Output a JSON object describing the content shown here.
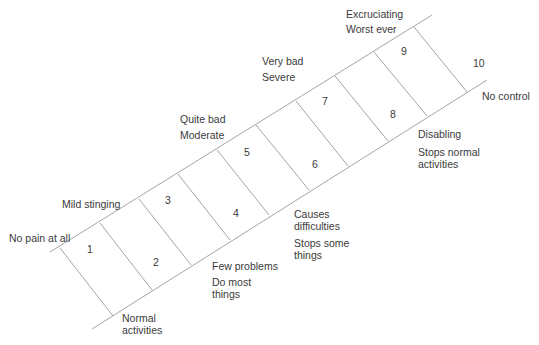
{
  "diagram": {
    "type": "pain-scale-ladder",
    "steps": [
      {
        "value": "1",
        "label": ""
      },
      {
        "value": "2",
        "label": ""
      },
      {
        "value": "3",
        "label": ""
      },
      {
        "value": "4",
        "label": ""
      },
      {
        "value": "5",
        "label": ""
      },
      {
        "value": "6",
        "label": ""
      },
      {
        "value": "7",
        "label": ""
      },
      {
        "value": "8",
        "label": ""
      },
      {
        "value": "9",
        "label": ""
      },
      {
        "value": "10",
        "label": ""
      }
    ],
    "upper_labels": {
      "no_pain": "No pain at all",
      "mild": "Mild stinging",
      "quite_bad": "Quite bad",
      "moderate": "Moderate",
      "very_bad": "Very bad",
      "severe": "Severe",
      "excruciating": "Excruciating",
      "worst_ever": "Worst ever"
    },
    "lower_labels": {
      "normal_1": "Normal",
      "normal_2": "activities",
      "few_problems": "Few problems",
      "do_most_1": "Do most",
      "do_most_2": "things",
      "causes_1": "Causes",
      "causes_2": "difficulties",
      "stops_some_1": "Stops some",
      "stops_some_2": "things",
      "disabling": "Disabling",
      "stops_normal_1": "Stops normal",
      "stops_normal_2": "activities",
      "no_control": "No control"
    },
    "line_color": "#9a9a9a"
  }
}
